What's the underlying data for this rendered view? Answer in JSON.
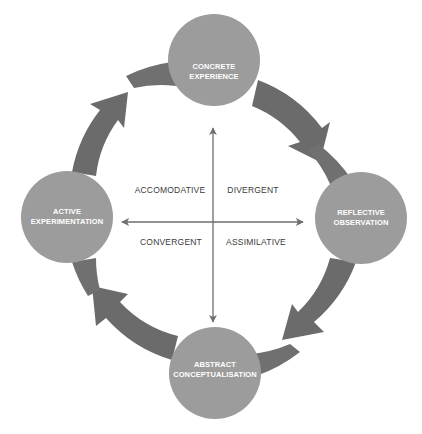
{
  "diagram": {
    "type": "learning-cycle",
    "colors": {
      "background": "#ffffff",
      "ring_arrow": "#6b6b6b",
      "stage_circle": "#9c9c9c",
      "stage_text": "#ffffff",
      "axis": "#6e6e6e",
      "quadrant_text": "#3a3a3a"
    },
    "stages": [
      {
        "id": "top",
        "line1": "CONCRETE",
        "line2": "EXPERIENCE"
      },
      {
        "id": "right",
        "line1": "REFLECTIVE",
        "line2": "OBSERVATION"
      },
      {
        "id": "bottom",
        "line1": "ABSTRACT",
        "line2": "CONCEPTUALISATION"
      },
      {
        "id": "left",
        "line1": "ACTIVE",
        "line2": "EXPERIMENTATION"
      }
    ],
    "quadrants": {
      "top_left": "ACCOMODATIVE",
      "top_right": "DIVERGENT",
      "bottom_left": "CONVERGENT",
      "bottom_right": "ASSIMILATIVE"
    },
    "cycle_direction": "clockwise",
    "axes": {
      "vertical": "double-headed arrow between CONCRETE EXPERIENCE and ABSTRACT CONCEPTUALISATION",
      "horizontal": "double-headed arrow between ACTIVE EXPERIMENTATION and REFLECTIVE OBSERVATION"
    }
  }
}
